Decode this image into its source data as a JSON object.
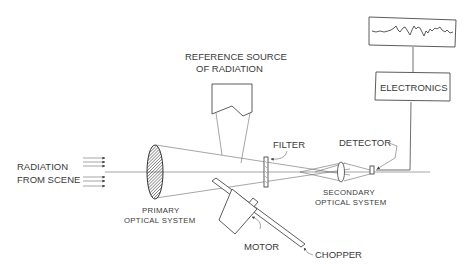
{
  "diagram": {
    "labels": {
      "radiation_from_scene_line1": "RADIATION",
      "radiation_from_scene_line2": "FROM SCENE",
      "reference_source_line1": "REFERENCE SOURCE",
      "reference_source_line2": "OF RADIATION",
      "primary_optical_line1": "PRIMARY",
      "primary_optical_line2": "OPTICAL SYSTEM",
      "filter": "FILTER",
      "detector": "DETECTOR",
      "secondary_optical_line1": "SECONDARY",
      "secondary_optical_line2": "OPTICAL SYSTEM",
      "electronics": "ELECTRONICS",
      "motor": "MOTOR",
      "chopper": "CHOPPER"
    },
    "components": [
      {
        "id": "incoming-radiation",
        "icon": "arrows-icon"
      },
      {
        "id": "primary-lens",
        "icon": "hatched-lens-icon"
      },
      {
        "id": "reference-source",
        "icon": "source-box-icon"
      },
      {
        "id": "chopper-blade",
        "icon": "diagonal-plate-icon"
      },
      {
        "id": "motor",
        "icon": "square-box-icon"
      },
      {
        "id": "filter",
        "icon": "filter-plate-icon"
      },
      {
        "id": "secondary-lens",
        "icon": "convex-lens-icon"
      },
      {
        "id": "detector",
        "icon": "detector-icon"
      },
      {
        "id": "electronics",
        "icon": "box-icon"
      },
      {
        "id": "signal-display",
        "icon": "waveform-icon"
      }
    ],
    "colors": {
      "stroke": "#4a4a4a",
      "text": "#3a3a3a",
      "background": "#ffffff"
    }
  }
}
